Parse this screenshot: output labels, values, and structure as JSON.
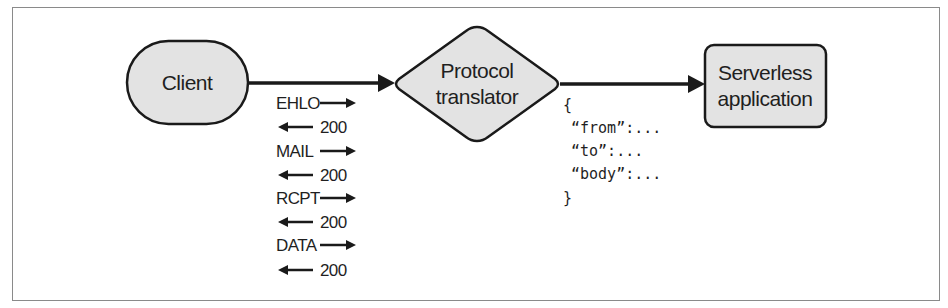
{
  "diagram": {
    "nodes": {
      "client": {
        "label": "Client",
        "shape": "stadium"
      },
      "translator": {
        "label_line1": "Protocol",
        "label_line2": "translator",
        "shape": "diamond"
      },
      "serverless": {
        "label_line1": "Serverless",
        "label_line2": "application",
        "shape": "rounded-rect"
      }
    },
    "edges": [
      {
        "from": "client",
        "to": "translator"
      },
      {
        "from": "translator",
        "to": "serverless"
      }
    ],
    "smtp_exchange": [
      {
        "label": "EHLO",
        "direction": "right"
      },
      {
        "label": "200",
        "direction": "left"
      },
      {
        "label": "MAIL",
        "direction": "right"
      },
      {
        "label": "200",
        "direction": "left"
      },
      {
        "label": "RCPT",
        "direction": "right"
      },
      {
        "label": "200",
        "direction": "left"
      },
      {
        "label": "DATA",
        "direction": "right"
      },
      {
        "label": "200",
        "direction": "left"
      }
    ],
    "json_payload": {
      "open": "{",
      "lines": [
        "“from”:...",
        "“to”:...",
        "“body”:..."
      ],
      "close": "}"
    },
    "colors": {
      "node_fill": "#e3e3e3",
      "stroke": "#1a1a1a",
      "frame": "#8a8a8a"
    }
  }
}
